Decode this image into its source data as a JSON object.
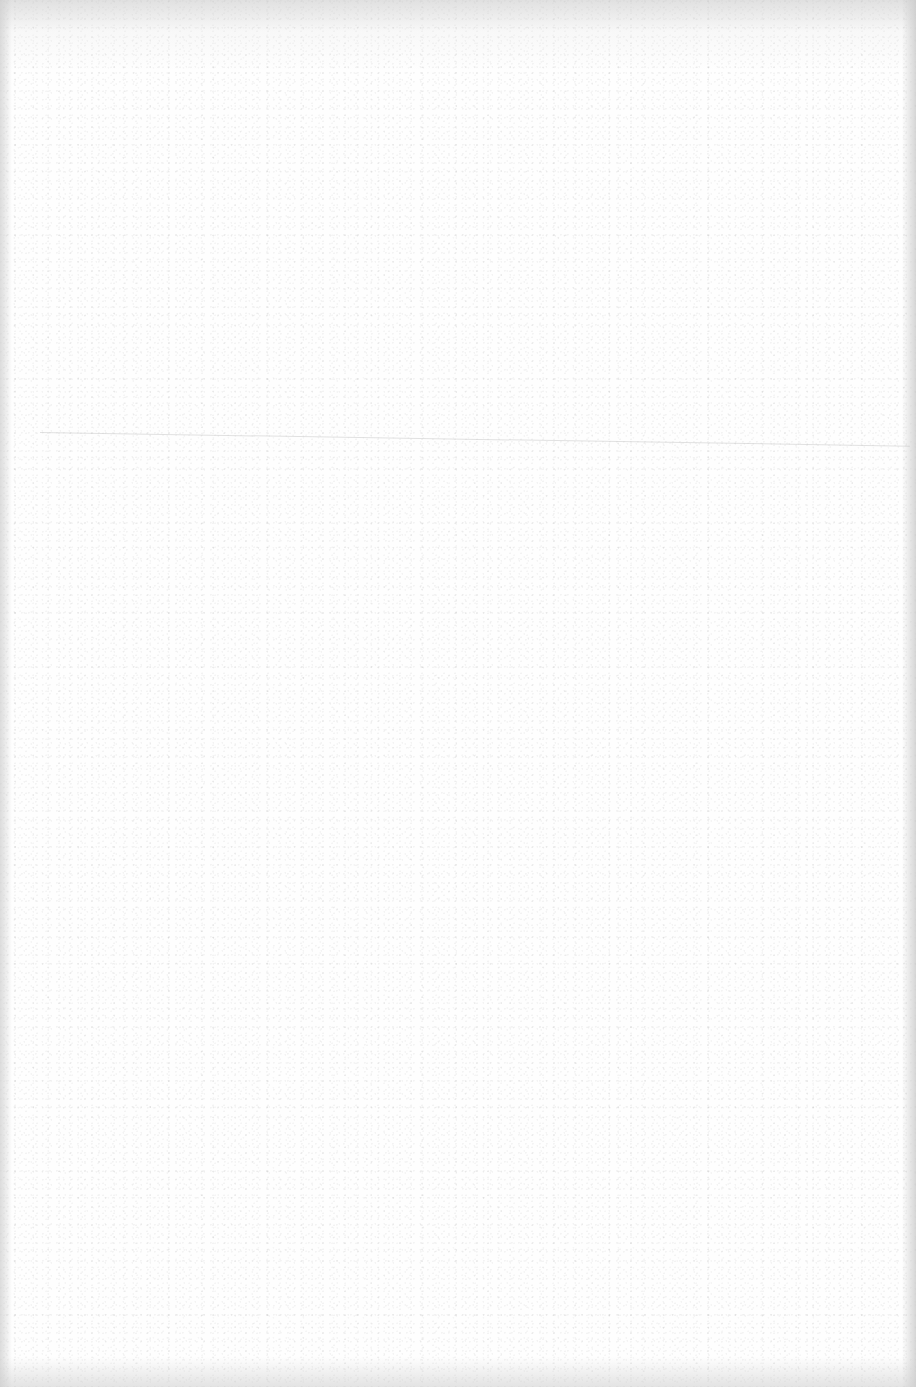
{
  "document": {
    "type": "scanned-page",
    "state": "blank",
    "text_content": [],
    "colors": {
      "paper": "#fefefe",
      "edge_shadow": "#c8c8c8",
      "crease": "#bebebe"
    }
  }
}
